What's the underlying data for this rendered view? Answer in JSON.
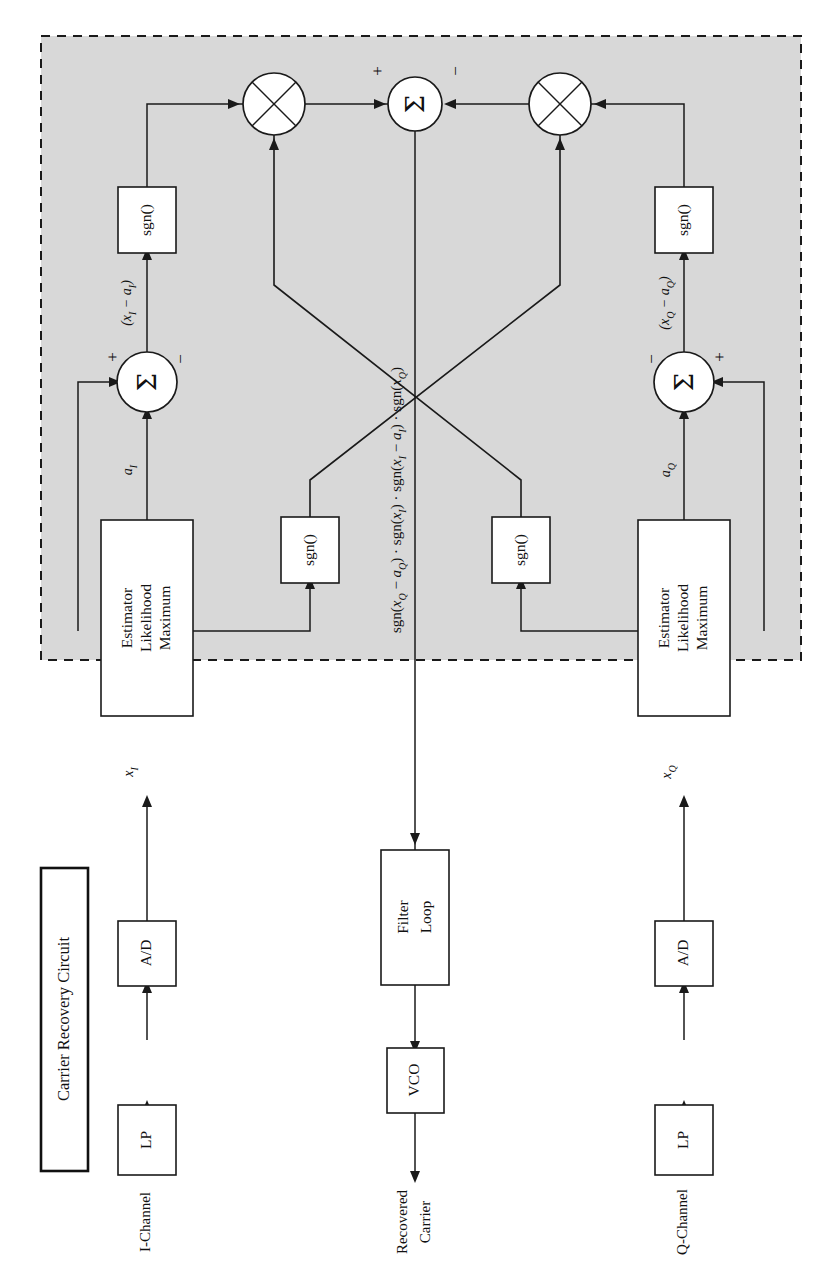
{
  "figure": {
    "kind": "block-diagram",
    "orientation": "rotated-90-ccw",
    "title_legend": "Carrier Recovery Circuit",
    "background": "#ffffff",
    "shaded_region_color": "#d8d8d8",
    "line_color": "#1a1a1a"
  },
  "inputs": {
    "i_channel": "I-Channel",
    "q_channel": "Q-Channel"
  },
  "output": {
    "recovered_carrier_line1": "Recovered",
    "recovered_carrier_line2": "Carrier"
  },
  "blocks": {
    "lp_i": "LP",
    "ad_i": "A/D",
    "lp_q": "LP",
    "ad_q": "A/D",
    "mle_i_line1": "Maximum",
    "mle_i_line2": "Likelihood",
    "mle_i_line3": "Estimator",
    "mle_q_line1": "Maximum",
    "mle_q_line2": "Likelihood",
    "mle_q_line3": "Estimator",
    "sgn_outer_i": "sgn()",
    "sgn_inner_i": "sgn()",
    "sgn_outer_q": "sgn()",
    "sgn_inner_q": "sgn()",
    "loop_filter_line1": "Loop",
    "loop_filter_line2": "Filter",
    "vco": "VCO"
  },
  "nodes": {
    "sum_i_symbol": "Σ",
    "sum_q_symbol": "Σ",
    "sum_center_symbol": "Σ",
    "mult_left_symbol": "⊗",
    "mult_right_symbol": "⊗",
    "sum_i_plus": "+",
    "sum_i_minus": "−",
    "sum_q_plus": "+",
    "sum_q_minus": "−",
    "sum_center_plus": "+",
    "sum_center_minus": "−"
  },
  "signals": {
    "x_i": "x I",
    "x_q": "x Q",
    "a_i": "a I",
    "a_q": "a Q",
    "err_i": "(x I − a I)",
    "err_q": "(x Q − a Q)",
    "phase_error": "sgn(x Q − a Q) · sgn(x I) · sgn(x I − a I) · sgn(x Q)"
  },
  "signals_parts": {
    "x_i_base": "x",
    "x_i_sub": "I",
    "x_q_base": "x",
    "x_q_sub": "Q",
    "a_i_base": "a",
    "a_i_sub": "I",
    "a_q_base": "a",
    "a_q_sub": "Q"
  }
}
